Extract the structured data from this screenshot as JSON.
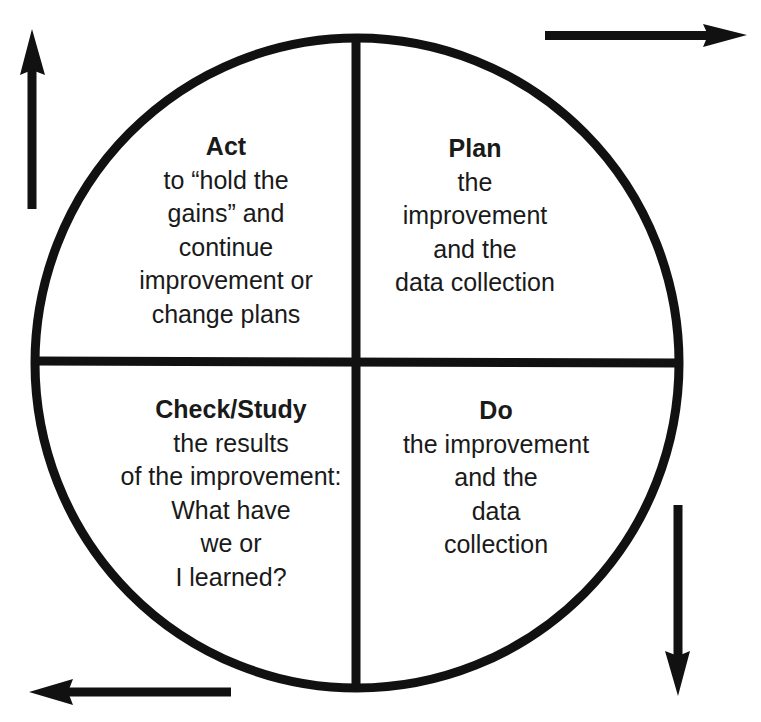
{
  "diagram": {
    "type": "PDSA cycle",
    "colors": {
      "stroke": "#111111",
      "text": "#1a1a1a",
      "background": "#ffffff"
    },
    "quadrants": [
      {
        "position": "top-left",
        "title": "Act",
        "lines": [
          "to “hold the",
          "gains” and",
          "continue",
          "improvement or",
          "change plans"
        ]
      },
      {
        "position": "top-right",
        "title": "Plan",
        "lines": [
          "the",
          "improvement",
          "and the",
          "data collection"
        ]
      },
      {
        "position": "bottom-left",
        "title": "Check/Study",
        "lines": [
          "the results",
          "of the improvement:",
          "What have",
          "we or",
          "I learned?"
        ]
      },
      {
        "position": "bottom-right",
        "title": "Do",
        "lines": [
          "the improvement",
          "and the",
          "data",
          "collection"
        ]
      }
    ],
    "arrows": [
      {
        "name": "arrow-up-icon",
        "position": "top-left",
        "direction": "up"
      },
      {
        "name": "arrow-right-icon",
        "position": "top-right",
        "direction": "right"
      },
      {
        "name": "arrow-down-icon",
        "position": "bottom-right",
        "direction": "down"
      },
      {
        "name": "arrow-left-icon",
        "position": "bottom-left",
        "direction": "left"
      }
    ]
  }
}
